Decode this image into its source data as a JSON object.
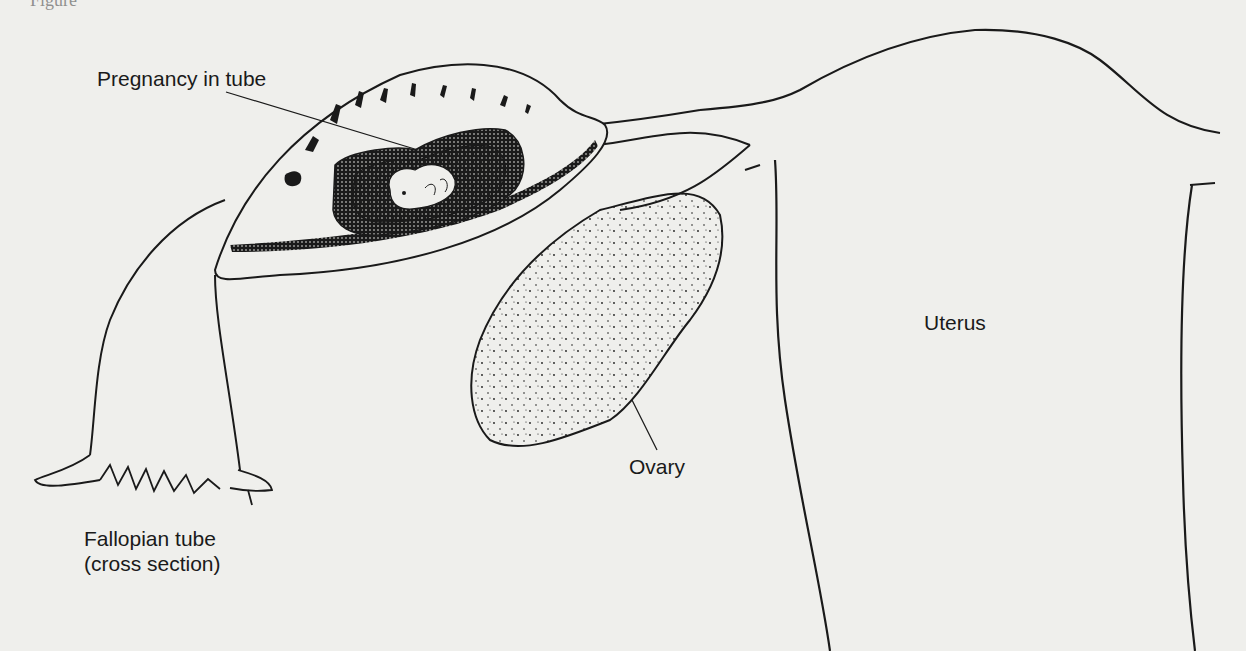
{
  "figure": {
    "caption_fragment": "Figure"
  },
  "labels": {
    "pregnancy": "Pregnancy in tube",
    "uterus": "Uterus",
    "ovary": "Ovary",
    "fallopian_line1": "Fallopian tube",
    "fallopian_line2": "(cross section)"
  },
  "colors": {
    "background": "#efefec",
    "ink": "#1a1a1a"
  }
}
